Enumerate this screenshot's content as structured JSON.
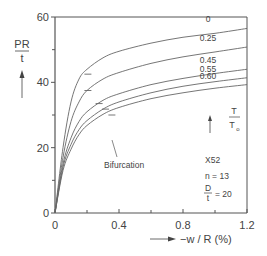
{
  "chart_data": {
    "type": "line",
    "title": "",
    "xlabel": "−w / R (%)",
    "ylabel": "PR / t",
    "xlim": [
      0,
      1.2
    ],
    "ylim": [
      0,
      60
    ],
    "x_ticks": [
      0,
      0.4,
      0.8,
      1.2
    ],
    "x_tick_labels": [
      "0",
      "0.4",
      "0.8",
      "1.2"
    ],
    "x_minor_ticks": [
      0.2,
      0.6,
      1.0
    ],
    "y_ticks": [
      0,
      20,
      40,
      60
    ],
    "y_tick_labels": [
      "0",
      "20",
      "40",
      "60"
    ],
    "y_minor_ticks": [
      10,
      30,
      50
    ],
    "grid": false,
    "legend_title": "T / T0",
    "series": [
      {
        "name": "0",
        "x": [
          0,
          0.05,
          0.1,
          0.15,
          0.2,
          0.3,
          0.4,
          0.6,
          0.8,
          1.0,
          1.2
        ],
        "values": [
          0,
          20,
          34,
          41,
          44,
          47.5,
          49.5,
          52,
          53.8,
          55,
          56.5
        ],
        "bifurcation": [
          0.19,
          42.5
        ]
      },
      {
        "name": "0.25",
        "x": [
          0,
          0.05,
          0.1,
          0.15,
          0.2,
          0.3,
          0.4,
          0.6,
          0.8,
          1.0,
          1.2
        ],
        "values": [
          0,
          17,
          28,
          34,
          37.5,
          41,
          43,
          45.8,
          47.8,
          49.3,
          50.8
        ],
        "bifurcation": [
          0.19,
          37.5
        ]
      },
      {
        "name": "0.45",
        "x": [
          0,
          0.05,
          0.1,
          0.15,
          0.2,
          0.3,
          0.4,
          0.6,
          0.8,
          1.0,
          1.2
        ],
        "values": [
          0,
          15,
          23,
          28,
          31,
          34.5,
          36.5,
          39.3,
          41.2,
          42.7,
          44.0
        ],
        "bifurcation": [
          0.26,
          33.5
        ]
      },
      {
        "name": "0.55",
        "x": [
          0,
          0.05,
          0.1,
          0.15,
          0.2,
          0.3,
          0.4,
          0.6,
          0.8,
          1.0,
          1.2
        ],
        "values": [
          0,
          14,
          21,
          25.5,
          28.3,
          31.8,
          34,
          36.8,
          38.8,
          40.2,
          41.4
        ],
        "bifurcation": [
          0.3,
          31.8
        ]
      },
      {
        "name": "0.60",
        "x": [
          0,
          0.05,
          0.1,
          0.15,
          0.2,
          0.3,
          0.4,
          0.6,
          0.8,
          1.0,
          1.2
        ],
        "values": [
          0,
          13,
          19.5,
          24,
          26.8,
          30.2,
          32.3,
          35,
          36.8,
          38.2,
          39.3
        ],
        "bifurcation": [
          0.34,
          30.0
        ]
      }
    ],
    "annotations": [
      {
        "text": "Bifurcation",
        "x": 0.37,
        "y": 21
      },
      {
        "text": "X52",
        "x": 1.0,
        "y": 17
      },
      {
        "text": "n = 13",
        "x": 1.0,
        "y": 12
      },
      {
        "text": "D / t = 20",
        "x": 1.0,
        "y": 7
      }
    ]
  },
  "labels": {
    "ylabel_num": "PR",
    "ylabel_den": "t",
    "xlabel": "−w / R (%)",
    "legend_num": "T",
    "legend_den": "T",
    "legend_den_sub": "o",
    "bifurcation": "Bifurcation",
    "material": "X52",
    "n_param": "n = 13",
    "dt_num": "D",
    "dt_den": "t",
    "dt_val": "= 20"
  }
}
